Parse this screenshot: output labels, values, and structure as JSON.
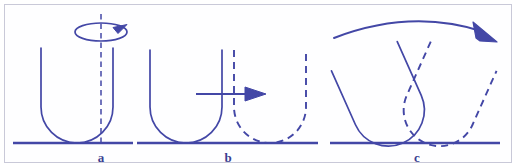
{
  "figure": {
    "stroke_color": "#4347a6",
    "baseline_color": "#4347a6",
    "frame_color": "#c9c9d8",
    "background_color": "#ffffff",
    "width": 516,
    "height": 167,
    "panels": [
      {
        "id": "a",
        "label": "a",
        "label_x": 101,
        "label_y": 161,
        "caption_role": "rotation-about-vertical-axis",
        "baseline": {
          "x1": 13,
          "x2": 133,
          "y": 143
        },
        "shape": {
          "type": "u-shape",
          "style": "solid",
          "left": 41,
          "right": 113,
          "top": 48,
          "bottom": 143,
          "corner_radius": 36
        },
        "axis": {
          "type": "dashed-vertical-axis",
          "x": 101,
          "y_top": 14,
          "y_bottom": 143
        },
        "spin_indicator": {
          "type": "ellipse-arrow",
          "cx": 101,
          "cy": 32,
          "rx": 26,
          "ry": 9,
          "arrow_side": "right"
        }
      },
      {
        "id": "b",
        "label": "b",
        "label_x": 228,
        "label_y": 161,
        "caption_role": "translation-along-horizontal",
        "baseline": {
          "x1": 137,
          "x2": 318,
          "y": 143
        },
        "shapes": [
          {
            "type": "u-shape",
            "style": "solid",
            "left": 150,
            "right": 222,
            "top": 50,
            "bottom": 143,
            "corner_radius": 36
          },
          {
            "type": "u-shape",
            "style": "dashed",
            "left": 234,
            "right": 306,
            "top": 50,
            "bottom": 143,
            "corner_radius": 36
          }
        ],
        "arrow": {
          "type": "straight-arrow",
          "x1": 196,
          "x2": 263,
          "y": 94,
          "direction": "right"
        }
      },
      {
        "id": "c",
        "label": "c",
        "label_x": 417,
        "label_y": 161,
        "caption_role": "rotation-of-cross-section",
        "baseline": {
          "x1": 330,
          "x2": 500,
          "y": 143
        },
        "shapes": [
          {
            "type": "u-shape-rotated",
            "style": "solid",
            "rotation_deg": -24,
            "pivot_x": 403,
            "pivot_y": 143
          },
          {
            "type": "u-shape-rotated",
            "style": "dashed",
            "rotation_deg": 24,
            "pivot_x": 425,
            "pivot_y": 143
          }
        ],
        "arc_arrow": {
          "type": "curved-arrow",
          "x1": 334,
          "y1": 37,
          "x2": 493,
          "y2": 34,
          "apex_x": 413,
          "apex_y": 14,
          "direction": "clockwise-right"
        }
      }
    ]
  }
}
